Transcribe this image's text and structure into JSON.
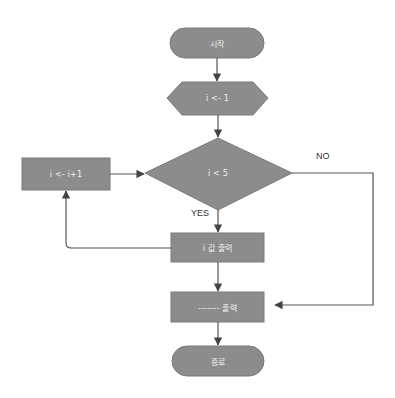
{
  "diagram": {
    "type": "flowchart",
    "colors": {
      "node_fill": "#8c8c8c",
      "node_stroke": "#7a7a7a",
      "node_text": "#f2f2f2",
      "edge": "#555555",
      "label_text": "#333333",
      "background": "#ffffff"
    },
    "nodes": [
      {
        "id": "start",
        "shape": "terminator",
        "label": "시작"
      },
      {
        "id": "init",
        "shape": "hexagon",
        "label": "i <- 1"
      },
      {
        "id": "cond",
        "shape": "diamond",
        "label": "i < 5"
      },
      {
        "id": "inc",
        "shape": "process",
        "label": "i <- i+1"
      },
      {
        "id": "print_i",
        "shape": "process",
        "label": "i 값 출력"
      },
      {
        "id": "print_line",
        "shape": "process",
        "label": "------- 출력"
      },
      {
        "id": "end",
        "shape": "terminator",
        "label": "종료"
      }
    ],
    "edges": [
      {
        "from": "start",
        "to": "init",
        "label": ""
      },
      {
        "from": "init",
        "to": "cond",
        "label": ""
      },
      {
        "from": "cond",
        "to": "print_i",
        "label": "YES"
      },
      {
        "from": "cond",
        "to": "print_line",
        "label": "NO"
      },
      {
        "from": "print_i",
        "to": "inc",
        "label": ""
      },
      {
        "from": "inc",
        "to": "cond",
        "label": ""
      },
      {
        "from": "print_i",
        "to": "print_line",
        "label": ""
      },
      {
        "from": "print_line",
        "to": "end",
        "label": ""
      }
    ],
    "labels": {
      "yes": "YES",
      "no": "NO"
    }
  }
}
